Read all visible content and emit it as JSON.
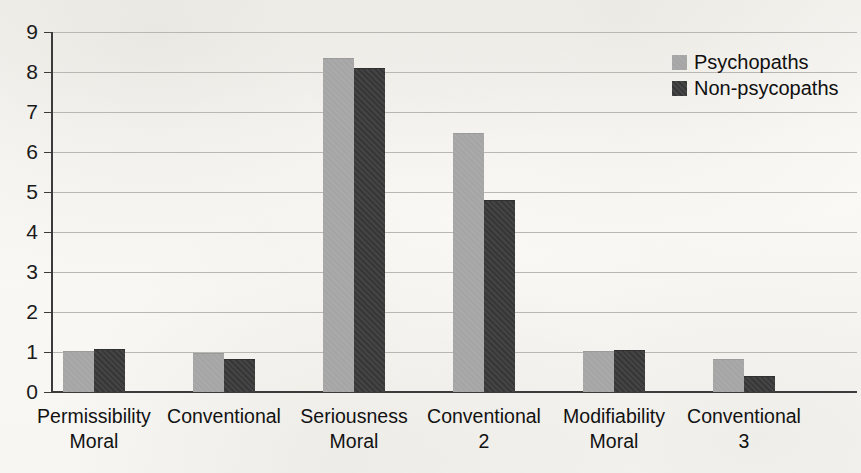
{
  "chart_data": {
    "type": "bar",
    "title": "",
    "subtitle": "",
    "xlabel": "",
    "ylabel": "",
    "ylim": [
      0,
      9
    ],
    "ytick_labels": [
      "9",
      "8",
      "7",
      "6",
      "5",
      "4",
      "3",
      "2",
      "1",
      "0"
    ],
    "grid": true,
    "legend_position": "top-right",
    "categories": [
      "Permissibility\nMoral",
      "Conventional",
      "Seriousness\nMoral",
      "Conventional\n2",
      "Modifiability\nMoral",
      "Conventional\n3"
    ],
    "category_lines": [
      {
        "line1": "Permissibility",
        "line2": "Moral"
      },
      {
        "line1": "Conventional",
        "line2": ""
      },
      {
        "line1": "Seriousness",
        "line2": "Moral"
      },
      {
        "line1": "Conventional",
        "line2": "2"
      },
      {
        "line1": "Modifiability",
        "line2": "Moral"
      },
      {
        "line1": "Conventional",
        "line2": "3"
      }
    ],
    "series": [
      {
        "name": "Psychopaths",
        "color": "#a8a8a8",
        "values": [
          1.0,
          0.95,
          8.33,
          6.45,
          1.0,
          0.8
        ]
      },
      {
        "name": "Non-psycopaths",
        "color": "#3a3a3a",
        "values": [
          1.05,
          0.8,
          8.08,
          4.78,
          1.03,
          0.38
        ]
      }
    ]
  },
  "legend": {
    "entries": [
      {
        "label": "Psychopaths",
        "swatch": "light-gray-swatch"
      },
      {
        "label": "Non-psycopaths",
        "swatch": "dark-gray-swatch"
      }
    ]
  },
  "axis": {
    "y_ticks": [
      "9",
      "8",
      "7",
      "6",
      "5",
      "4",
      "3",
      "2",
      "1",
      "0"
    ]
  },
  "colors": {
    "series_light": "#a8a8a8",
    "series_dark": "#3a3a3a",
    "gridline": "#b9b7b2",
    "axis": "#3b3b3b",
    "background": "#f7f6f2",
    "text": "#121212"
  }
}
